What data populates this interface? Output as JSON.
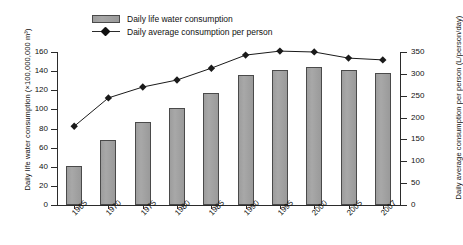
{
  "chart_data": {
    "type": "bar",
    "title": "",
    "categories": [
      "1965",
      "1970",
      "1975",
      "1980",
      "1985",
      "1990",
      "1995",
      "2000",
      "2005",
      "2007"
    ],
    "xlabel": "",
    "ylabel": "Daily life water consumption (×100,000,000 m³)",
    "ylabel_right": "Daily average consumption per person (L/person/day)",
    "ylim": [
      0,
      160
    ],
    "ylim_right": [
      0,
      350
    ],
    "yticks": [
      0,
      20,
      40,
      60,
      80,
      100,
      120,
      140,
      160
    ],
    "yticks_right": [
      0,
      50,
      100,
      150,
      200,
      250,
      300,
      350
    ],
    "grid": false,
    "legend_position": "top-center",
    "series": [
      {
        "name": "Daily life water consumption",
        "type": "bar",
        "axis": "left",
        "color": "#a3a3a3",
        "values": [
          41,
          68,
          87,
          101,
          117,
          136,
          141,
          144,
          141,
          138
        ]
      },
      {
        "name": "Daily average consumption per person",
        "type": "line",
        "axis": "right",
        "color": "#1a1a1a",
        "marker": "diamond",
        "values": [
          180,
          245,
          270,
          286,
          313,
          343,
          352,
          350,
          336,
          332
        ]
      }
    ]
  },
  "legend": {
    "items": [
      {
        "label": "Daily life water consumption",
        "marker": "bar-swatch"
      },
      {
        "label": "Daily average consumption per person",
        "marker": "line-diamond"
      }
    ]
  },
  "axes": {
    "left": {
      "title": "Daily life water consumption (×100,000,000 m³)",
      "ticks": [
        "0",
        "20",
        "40",
        "60",
        "80",
        "100",
        "120",
        "140",
        "160"
      ]
    },
    "right": {
      "title": "Daily average consumption per person (L/person/day)",
      "ticks": [
        "0",
        "50",
        "100",
        "150",
        "200",
        "250",
        "300",
        "350"
      ]
    },
    "bottom": {
      "ticks": [
        "1965",
        "1970",
        "1975",
        "1980",
        "1985",
        "1990",
        "1995",
        "2000",
        "2005",
        "2007"
      ]
    }
  }
}
